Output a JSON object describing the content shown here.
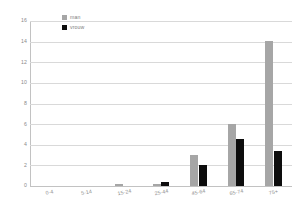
{
  "chart_data": {
    "type": "bar",
    "title": "",
    "xlabel": "",
    "ylabel": "",
    "ylim": [
      0,
      16
    ],
    "ytick_step": 2,
    "grid": true,
    "legend_position": "top-left-inside",
    "categories": [
      "0-4",
      "5-14",
      "15-24",
      "25-44",
      "45-64",
      "65-74",
      "75+"
    ],
    "yticks": [
      "16",
      "14",
      "12",
      "10",
      "8",
      "6",
      "4",
      "2",
      "0"
    ],
    "series": [
      {
        "name": "man",
        "color": "#a6a6a6",
        "values": [
          0,
          0,
          0.2,
          0.15,
          3.0,
          6.0,
          14.1
        ]
      },
      {
        "name": "vrouw",
        "color": "#0d0d0d",
        "values": [
          0,
          0,
          0,
          0.4,
          2.0,
          4.6,
          3.4
        ]
      }
    ]
  },
  "legend": {
    "items": [
      {
        "label": "man",
        "swatch": "man-swatch"
      },
      {
        "label": "vrouw",
        "swatch": "vrouw-swatch"
      }
    ]
  },
  "colors": {
    "man": "#a6a6a6",
    "vrouw": "#0d0d0d",
    "gridline": "#d9d9d9",
    "axis": "#c2c2c2",
    "tick_text": "#8a8a8a",
    "background": "#ffffff"
  }
}
